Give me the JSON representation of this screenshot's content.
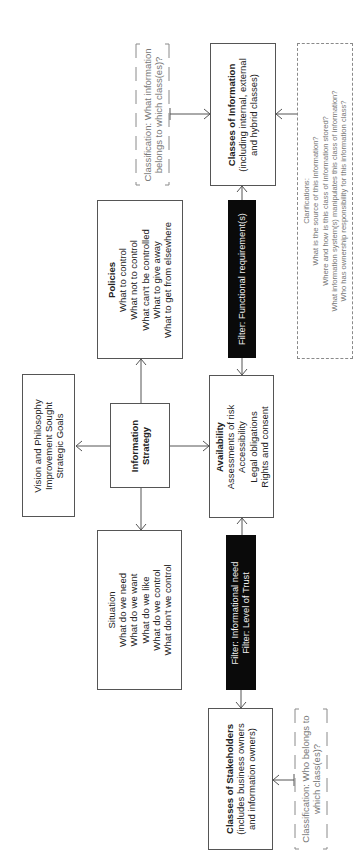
{
  "diagram": {
    "orientation": "rotated-90-ccw",
    "nodes": {
      "information_strategy": {
        "title_line1": "Information",
        "title_line2": "Strategy"
      },
      "vision": {
        "lines": [
          "Vision and Philosophy",
          "Improvement Sought",
          "Strategic Goals"
        ]
      },
      "policies": {
        "title": "Policies",
        "lines": [
          "What to control",
          "What not to control",
          "What can't be controlled",
          "What to give away",
          "What to get from elsewhere"
        ]
      },
      "situation": {
        "lines": [
          "Situation",
          "What do we need",
          "What do we want",
          "What do we like",
          "What do we control",
          "What don't we control"
        ]
      },
      "availability": {
        "title": "Availability",
        "lines": [
          "Assessments of risk",
          "Accessibility",
          "Legal obligations",
          "Rights and consent"
        ]
      },
      "classes_of_information": {
        "title": "Classes of Information",
        "lines": [
          "(including internal, external",
          "and hybrid classes)"
        ]
      },
      "classes_of_stakeholders": {
        "title": "Classes of Stakeholders",
        "lines": [
          "(includes business owners",
          "and information owners)"
        ]
      },
      "filter_functional": {
        "lines": [
          "Filter: Functional requirement(s)"
        ]
      },
      "filter_need_trust": {
        "lines": [
          "Filter: Informational need",
          "Filter: Level of Trust"
        ]
      },
      "classification_information": {
        "lines": [
          "Classification: What information",
          "belongs to which class(es)?"
        ]
      },
      "classification_stakeholders": {
        "lines": [
          "Classification: Who belongs to",
          "which class(es)?"
        ]
      },
      "clarifications": {
        "lines": [
          "Clarifications:",
          "What is the source of this information?",
          "Where and how is this class of information stored?",
          "What information system(s) manipulates this class of information?",
          "Who has ownership responsibility for this information class?"
        ]
      }
    },
    "colors": {
      "box_border": "#555555",
      "filter_fill": "#0a0a0a",
      "filter_text": "#f2f2f2",
      "dashed_border": "#8a8a8a",
      "arrow": "#555555"
    }
  }
}
